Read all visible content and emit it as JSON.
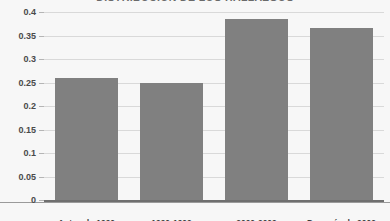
{
  "chart_data": {
    "type": "bar",
    "title": "DISTRIBUCION DE LOS HALLAZGOS",
    "xlabel": "",
    "ylabel": "",
    "categories": [
      "Antes de 1990",
      "1990-1999",
      "2000-2009",
      "Después de 2009"
    ],
    "values": [
      0.26,
      0.25,
      0.385,
      0.365
    ],
    "ylim": [
      0,
      0.4
    ],
    "yticks": [
      0,
      0.05,
      0.1,
      0.15,
      0.2,
      0.25,
      0.3,
      0.35,
      0.4
    ],
    "ytick_labels": [
      "0",
      "0.05",
      "0.1",
      "0.15",
      "0.2",
      "0.25",
      "0.3",
      "0.35",
      "0.4"
    ],
    "grid": true,
    "legend": null,
    "series": [
      {
        "name": "",
        "values": [
          0.26,
          0.25,
          0.385,
          0.365
        ]
      }
    ],
    "colors": {
      "bar_fill": "#808080",
      "gridline": "#d9d9d9",
      "axis": "#6f6f6f",
      "background": "#f7f7f7",
      "tick_text": "#4a4a4a",
      "category_text": "#3d3d3d"
    }
  }
}
